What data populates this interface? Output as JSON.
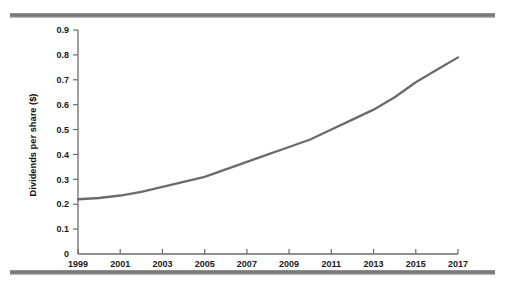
{
  "figure": {
    "decorations": {
      "top_rule": "horizontal-rule",
      "bottom_rule": "horizontal-rule"
    }
  },
  "chart_data": {
    "type": "line",
    "title": "",
    "xlabel": "",
    "ylabel": "Dividends per share ($)",
    "xlim": [
      1999,
      2017
    ],
    "ylim": [
      0,
      0.9
    ],
    "grid": false,
    "legend": null,
    "ytick_labels": [
      "0.9",
      "0.8",
      "0.7",
      "0.6",
      "0.5",
      "0.4",
      "0.3",
      "0.2",
      "0.1",
      "0"
    ],
    "ytick_values": [
      0.9,
      0.8,
      0.7,
      0.6,
      0.5,
      0.4,
      0.3,
      0.2,
      0.1,
      0
    ],
    "xtick_labels": [
      "1999",
      "2001",
      "2003",
      "2005",
      "2007",
      "2009",
      "2011",
      "2013",
      "2015",
      "2017"
    ],
    "xtick_values": [
      1999,
      2001,
      2003,
      2005,
      2007,
      2009,
      2011,
      2013,
      2015,
      2017
    ],
    "x": [
      1999,
      2000,
      2001,
      2002,
      2003,
      2004,
      2005,
      2006,
      2007,
      2008,
      2009,
      2010,
      2011,
      2012,
      2013,
      2014,
      2015,
      2016,
      2017
    ],
    "values": [
      0.22,
      0.225,
      0.235,
      0.25,
      0.27,
      0.29,
      0.31,
      0.34,
      0.37,
      0.4,
      0.43,
      0.46,
      0.5,
      0.54,
      0.58,
      0.63,
      0.69,
      0.74,
      0.79
    ],
    "series": [
      {
        "name": "Dividends per share",
        "color": "#6b6b6b",
        "values": [
          0.22,
          0.225,
          0.235,
          0.25,
          0.27,
          0.29,
          0.31,
          0.34,
          0.37,
          0.4,
          0.43,
          0.46,
          0.5,
          0.54,
          0.58,
          0.63,
          0.69,
          0.74,
          0.79
        ]
      }
    ]
  }
}
